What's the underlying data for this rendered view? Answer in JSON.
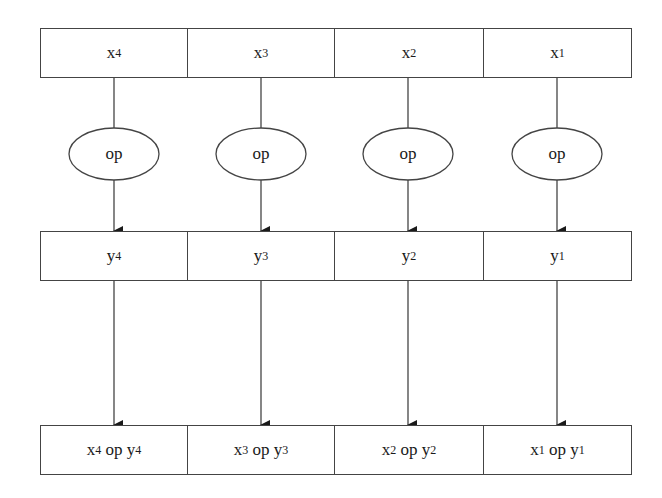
{
  "diagram": {
    "type": "vector-operation",
    "columns": [
      {
        "x_label": "x",
        "x_sub": "4",
        "op": "op",
        "y_label": "y",
        "y_sub": "4",
        "r_x": "x",
        "r_x_sub": "4",
        "r_op": " op ",
        "r_y": "y",
        "r_y_sub": "4"
      },
      {
        "x_label": "x",
        "x_sub": "3",
        "op": "op",
        "y_label": "y",
        "y_sub": "3",
        "r_x": "x",
        "r_x_sub": "3",
        "r_op": " op ",
        "r_y": "y",
        "r_y_sub": "3"
      },
      {
        "x_label": "x",
        "x_sub": "2",
        "op": "op",
        "y_label": "y",
        "y_sub": "2",
        "r_x": "x",
        "r_x_sub": "2",
        "r_op": " op ",
        "r_y": "y",
        "r_y_sub": "2"
      },
      {
        "x_label": "x",
        "x_sub": "1",
        "op": "op",
        "y_label": "y",
        "y_sub": "1",
        "r_x": "x",
        "r_x_sub": "1",
        "r_op": " op ",
        "r_y": "y",
        "r_y_sub": "1"
      }
    ],
    "rows": {
      "input_row": "x vector (x4, x3, x2, x1)",
      "second_row": "y vector (y4, y3, y2, y1)",
      "result_row": "x op y"
    },
    "colors": {
      "stroke": "#444444",
      "text": "#1a1a1a",
      "background": "#ffffff"
    }
  }
}
